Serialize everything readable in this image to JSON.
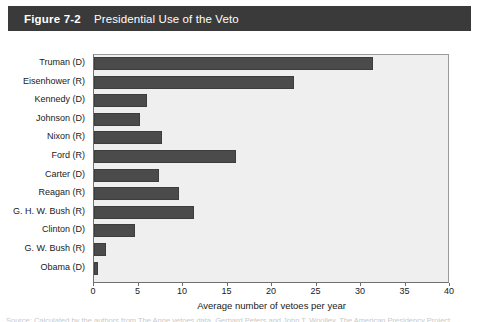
{
  "header": {
    "figure_label": "Figure 7-2",
    "title": "Presidential Use of the Veto",
    "bar_color": "#3a3a3a",
    "text_color": "#ffffff"
  },
  "source_note": "Source: Calculated by the authors from The Anne vetoes data, Gerhard Peters and John T. Woolley, The American Presidency Project.",
  "chart_data": {
    "type": "bar",
    "orientation": "horizontal",
    "title": "Presidential Use of the Veto",
    "xlabel": "Average number of vetoes per year",
    "ylabel": "",
    "xlim": [
      0,
      40
    ],
    "xticks": [
      0,
      5,
      10,
      15,
      20,
      25,
      30,
      35,
      40
    ],
    "xtick_labels": [
      "0",
      "5",
      "10",
      "15",
      "20",
      "25",
      "30",
      "35",
      "40"
    ],
    "grid": false,
    "legend": false,
    "bar_color": "#4b4b4b",
    "plot_background": "#efefef",
    "categories": [
      "Truman (D)",
      "Eisenhower (R)",
      "Kennedy (D)",
      "Johnson (D)",
      "Nixon (R)",
      "Ford (R)",
      "Carter (D)",
      "Reagan (R)",
      "G. H. W. Bush (R)",
      "Clinton (D)",
      "G. W. Bush (R)",
      "Obama (D)"
    ],
    "values": [
      31.4,
      22.5,
      6.0,
      5.2,
      7.6,
      15.9,
      7.3,
      9.6,
      11.2,
      4.6,
      1.4,
      0.5
    ]
  }
}
